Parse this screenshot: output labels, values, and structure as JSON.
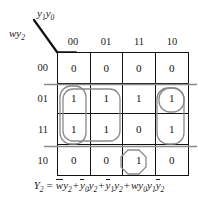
{
  "figure": {
    "type": "karnaugh-map",
    "column_variables": "y1y0",
    "row_variables": "wy2",
    "column_headers": [
      "00",
      "01",
      "11",
      "10"
    ],
    "row_headers": [
      "00",
      "01",
      "11",
      "10"
    ],
    "grid_values": [
      [
        "0",
        "0",
        "0",
        "0"
      ],
      [
        "1",
        "1",
        "1",
        "1"
      ],
      [
        "1",
        "1",
        "0",
        "1"
      ],
      [
        "0",
        "0",
        "1",
        "0"
      ]
    ],
    "loop_color": "#8a8a8a",
    "line_color": "#111111"
  },
  "labels": {
    "col_var_base": "y",
    "col_var_sub1": "1",
    "col_var_base2": "y",
    "col_var_sub2": "0",
    "row_var_w": "w",
    "row_var_y": "y",
    "row_var_sub": "2"
  },
  "equation": {
    "lhs": "Y",
    "lhs_sub": "2",
    "equals": "=",
    "terms": [
      {
        "w_bar": "w",
        "y": "y",
        "y_sub": "2"
      },
      {
        "y_bar": "y",
        "bar_sub": "0",
        "y": "y",
        "y_sub": "2"
      },
      {
        "y_bar": "y",
        "bar_sub": "1",
        "y": "y",
        "y_sub": "2"
      },
      {
        "w": "w",
        "y0": "y",
        "y0_sub": "0",
        "y1": "y",
        "y1_sub": "1",
        "y2_bar": "y",
        "y2_sub": "2"
      }
    ],
    "plus": "+"
  }
}
